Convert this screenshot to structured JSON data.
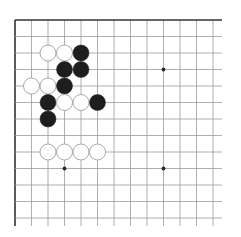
{
  "board": {
    "label": "Go board corner (partial)",
    "origin_x": 15,
    "origin_y": 20,
    "spacing": 16.5,
    "cols": 13,
    "rows": 13,
    "grid_right": 222,
    "grid_bottom": 226,
    "colors": {
      "background": "#ffffff",
      "grid_line": "#9a9a9a",
      "border_line": "#333333",
      "black_stone": "#1e1e1e",
      "white_stone_fill": "#ffffff",
      "white_stone_edge": "#a0a0a0",
      "star_point": "#2a2a2a"
    },
    "star_points": [
      {
        "col": 9,
        "row": 3
      },
      {
        "col": 3,
        "row": 9
      },
      {
        "col": 9,
        "row": 9
      }
    ],
    "stones": [
      {
        "color": "white",
        "col": 2,
        "row": 2
      },
      {
        "color": "white",
        "col": 3,
        "row": 2
      },
      {
        "color": "black",
        "col": 4,
        "row": 2
      },
      {
        "color": "black",
        "col": 3,
        "row": 3
      },
      {
        "color": "black",
        "col": 4,
        "row": 3
      },
      {
        "color": "white",
        "col": 1,
        "row": 4
      },
      {
        "color": "white",
        "col": 2,
        "row": 4
      },
      {
        "color": "black",
        "col": 3,
        "row": 4
      },
      {
        "color": "black",
        "col": 2,
        "row": 5
      },
      {
        "color": "white",
        "col": 3,
        "row": 5
      },
      {
        "color": "white",
        "col": 4,
        "row": 5
      },
      {
        "color": "black",
        "col": 5,
        "row": 5
      },
      {
        "color": "black",
        "col": 2,
        "row": 6
      },
      {
        "color": "white",
        "col": 2,
        "row": 8
      },
      {
        "color": "white",
        "col": 3,
        "row": 8
      },
      {
        "color": "white",
        "col": 4,
        "row": 8
      },
      {
        "color": "white",
        "col": 5,
        "row": 8
      }
    ]
  }
}
